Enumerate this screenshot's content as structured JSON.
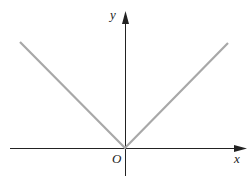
{
  "diagram": {
    "title": "",
    "type": "function graph y=|x|",
    "axes": {
      "x_label": "x",
      "y_label": "y",
      "origin_label": "O"
    },
    "curve": {
      "name": "absolute value graph",
      "color": "#a8a8a8",
      "points": [
        [
          20,
          42
        ],
        [
          125,
          148
        ],
        [
          228,
          43
        ]
      ]
    },
    "axis_color": "#222222"
  }
}
